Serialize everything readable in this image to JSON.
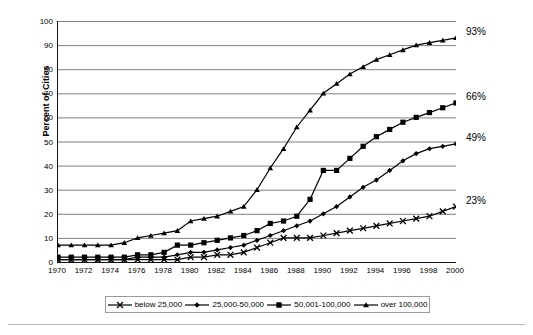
{
  "chart_data": {
    "type": "line",
    "title": "",
    "subtitle": "",
    "xlabel": "",
    "ylabel": "Percent of Cities",
    "xlim": [
      1970,
      2000
    ],
    "ylim": [
      0,
      100
    ],
    "grid": true,
    "legend_position": "bottom",
    "yticks": [
      0,
      10,
      20,
      30,
      40,
      50,
      60,
      70,
      80,
      90,
      100
    ],
    "xticks": [
      1970,
      1972,
      1974,
      1976,
      1978,
      1980,
      1982,
      1984,
      1986,
      1988,
      1990,
      1992,
      1994,
      1996,
      1998,
      2000
    ],
    "x": [
      1970,
      1971,
      1972,
      1973,
      1974,
      1975,
      1976,
      1977,
      1978,
      1979,
      1980,
      1981,
      1982,
      1983,
      1984,
      1985,
      1986,
      1987,
      1988,
      1989,
      1990,
      1991,
      1992,
      1993,
      1994,
      1995,
      1996,
      1997,
      1998,
      1999,
      2000
    ],
    "series": [
      {
        "name": "below 25,000",
        "marker": "x",
        "values": [
          1,
          1,
          1,
          1,
          1,
          1,
          1,
          1,
          1,
          1,
          2,
          2,
          3,
          3,
          4,
          6,
          8,
          10,
          10,
          10,
          11,
          12,
          13,
          14,
          15,
          16,
          17,
          18,
          19,
          21,
          23
        ]
      },
      {
        "name": "25,000-50,000",
        "marker": "diamond",
        "values": [
          1,
          1,
          1,
          1,
          1,
          1,
          2,
          2,
          2,
          3,
          4,
          4,
          5,
          6,
          7,
          9,
          11,
          13,
          15,
          17,
          20,
          23,
          27,
          31,
          34,
          38,
          42,
          45,
          47,
          48,
          49
        ]
      },
      {
        "name": "50,001-100,000",
        "marker": "square",
        "values": [
          2,
          2,
          2,
          2,
          2,
          2,
          3,
          3,
          4,
          7,
          7,
          8,
          9,
          10,
          11,
          13,
          16,
          17,
          19,
          26,
          38,
          38,
          43,
          48,
          52,
          55,
          58,
          60,
          62,
          64,
          66
        ]
      },
      {
        "name": "over 100,000",
        "marker": "triangle",
        "values": [
          7,
          7,
          7,
          7,
          7,
          8,
          10,
          11,
          12,
          13,
          17,
          18,
          19,
          21,
          23,
          30,
          39,
          47,
          56,
          63,
          70,
          74,
          78,
          81,
          84,
          86,
          88,
          90,
          91,
          92,
          93
        ]
      }
    ],
    "annotations": [
      {
        "label": "93%",
        "value": 93,
        "series": "over 100,000"
      },
      {
        "label": "66%",
        "value": 66,
        "series": "50,001-100,000"
      },
      {
        "label": "49%",
        "value": 49,
        "series": "25,000-50,000"
      },
      {
        "label": "23%",
        "value": 23,
        "series": "below 25,000"
      }
    ],
    "legend": [
      {
        "label": "below 25,000",
        "marker": "x"
      },
      {
        "label": "25,000-50,000",
        "marker": "diamond"
      },
      {
        "label": "50,001-100,000",
        "marker": "square"
      },
      {
        "label": "over 100,000",
        "marker": "triangle"
      }
    ],
    "colors": {
      "line": "#000000",
      "grid": "#808080",
      "axis": "#111111",
      "background": "#ffffff"
    }
  }
}
